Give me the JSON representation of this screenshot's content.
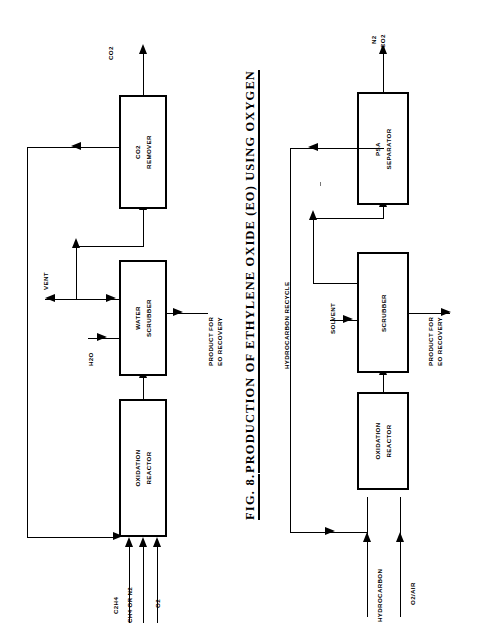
{
  "figure": {
    "number": "FIG. 8.",
    "title": "PRODUCTION OF ETHYLENE OXIDE  (EO)  USING  OXYGEN",
    "domain": "process-flow-diagram",
    "orientation": "rotated-90-ccw"
  },
  "colors": {
    "line": "#000000",
    "background": "#ffffff",
    "text": "#000000"
  },
  "air_process": {
    "name": "air-based-process",
    "units": [
      {
        "id": "oxidation-reactor",
        "line1": "OXIDATION",
        "line2": "REACTOR"
      },
      {
        "id": "water-scrubber",
        "line1": "WATER",
        "line2": "SCRUBBER"
      },
      {
        "id": "co2-remover",
        "line1": "CO2",
        "line2": "REMOVER"
      }
    ],
    "streams": {
      "feed_1": "C2H4",
      "feed_2": "CH4 OR N2",
      "feed_3": "O2",
      "water_in": "H2O",
      "vent": "VENT",
      "co2_out": "CO2",
      "product_line1": "PRODUCT FOR",
      "product_line2": "EO RECOVERY"
    }
  },
  "oxygen_process": {
    "name": "oxygen-based-process",
    "units": [
      {
        "id": "oxidation-reactor",
        "line1": "OXIDATION",
        "line2": "REACTOR"
      },
      {
        "id": "scrubber",
        "line1": "",
        "line2": "SCRUBBER"
      },
      {
        "id": "psa-separator",
        "line1": "PSA",
        "line2": "SEPARATOR"
      }
    ],
    "streams": {
      "feed_1": "HYDROCARBON",
      "feed_2": "O2/AIR",
      "solvent": "SOLVENT",
      "recycle": "HYDROCARBON  RECYCLE",
      "out_1": "N2",
      "out_2": "CO2",
      "product_line1": "PRODUCT FOR",
      "product_line2": "EO RECOVERY"
    }
  }
}
